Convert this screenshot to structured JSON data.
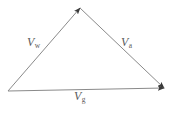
{
  "figure": {
    "kind": "vector-triangle-diagram",
    "background_color": "#ffffff",
    "line_color": "#8a8a8a",
    "label_color": "#5b5b5b"
  },
  "labels": {
    "wind": {
      "symbol": "V",
      "subscript": "w"
    },
    "air": {
      "symbol": "V",
      "subscript": "a"
    },
    "ground": {
      "symbol": "V",
      "subscript": "g"
    }
  },
  "chart_data": {
    "type": "diagram",
    "title": "",
    "vectors": [
      {
        "name": "V_w",
        "symbol": "V",
        "subscript": "w",
        "from": [
          8,
          91
        ],
        "to": [
          80,
          8
        ],
        "arrowhead_at": "to",
        "label_position": [
          27,
          36
        ]
      },
      {
        "name": "V_a",
        "symbol": "V",
        "subscript": "a",
        "from": [
          80,
          8
        ],
        "to": [
          164,
          88
        ],
        "arrowhead_at": "to",
        "label_position": [
          121,
          36
        ]
      },
      {
        "name": "V_g",
        "symbol": "V",
        "subscript": "g",
        "from": [
          8,
          91
        ],
        "to": [
          164,
          88
        ],
        "arrowhead_at": "to",
        "label_position": [
          74,
          90
        ]
      }
    ],
    "vertices": [
      {
        "name": "origin",
        "point": [
          8,
          91
        ]
      },
      {
        "name": "apex",
        "point": [
          80,
          8
        ]
      },
      {
        "name": "terminus",
        "point": [
          164,
          88
        ]
      }
    ]
  }
}
